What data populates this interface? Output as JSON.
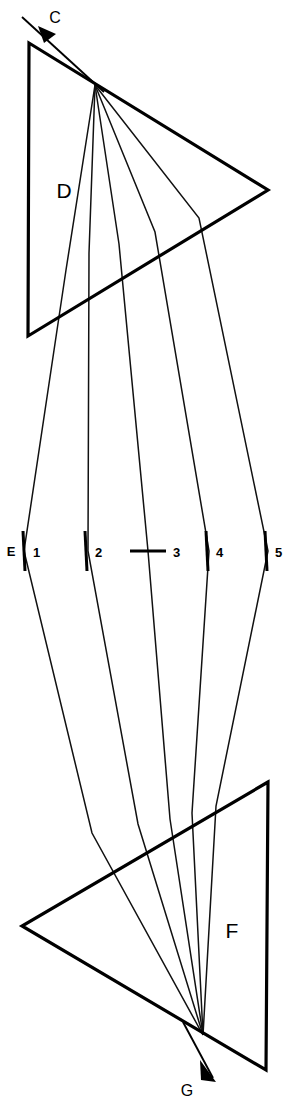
{
  "figure": {
    "background_color": "#ffffff",
    "line_color": "#000000",
    "width": 288,
    "height": 1110
  },
  "labels": {
    "prism_upper": "D",
    "prism_lower": "F",
    "input_beam": "C",
    "output_beam": "G",
    "focal_plane": "E"
  },
  "spectral_lines": [
    {
      "number": "1",
      "x": 24,
      "tick_type": "vertical"
    },
    {
      "number": "2",
      "x": 88,
      "tick_type": "vertical"
    },
    {
      "number": "3",
      "x": 148,
      "tick_type": "horizontal"
    },
    {
      "number": "4",
      "x": 209,
      "tick_type": "vertical"
    },
    {
      "number": "5",
      "x": 268,
      "tick_type": "vertical"
    }
  ],
  "geometry": {
    "prism_upper_vertices": "29,43 268,190 28,336",
    "prism_lower_vertices": "268,782 22,926 266,1070",
    "input_ray": "M 22,17 L 104,92",
    "input_arrow_head": "38,26 56,34 44,43",
    "output_ray": "M 183,1022 L 213,1078",
    "output_arrow_head": "200,1060 216,1082 201,1080",
    "focal_plane_y": 551,
    "fan_origin_upper": "95,85",
    "fan_converge_lower": "203,1035",
    "ray_paths": [
      "M 95,85 L 66,270 L 24,551 L 92,833 L 203,1035",
      "M 95,85 L 89,253 L 88,551 L 138,824 L 203,1035",
      "M 95,85 L 119,244 L 148,551 L 170,819 L 203,1035",
      "M 95,85 L 155,232 L 209,551 L 192,813 L 203,1035",
      "M 95,85 L 199,218 L 268,551 L 216,806 L 203,1035"
    ]
  }
}
